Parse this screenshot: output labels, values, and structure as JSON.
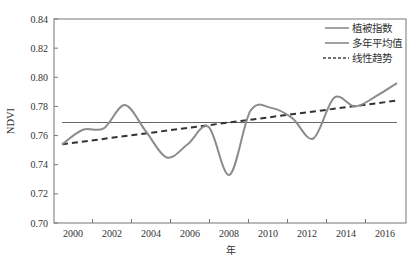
{
  "chart_data": {
    "type": "line",
    "title": "",
    "xlabel": "年",
    "ylabel": "NDVI",
    "ylim": [
      0.7,
      0.84
    ],
    "yticks": [
      0.7,
      0.72,
      0.74,
      0.76,
      0.78,
      0.8,
      0.82,
      0.84
    ],
    "ytick_labels": [
      "0.70",
      "0.72",
      "0.74",
      "0.76",
      "0.78",
      "0.80",
      "0.82",
      "0.84"
    ],
    "xtick_labels": [
      "2000",
      "2002",
      "2004",
      "2006",
      "2008",
      "2010",
      "2012",
      "2014",
      "2016"
    ],
    "grid": false,
    "legend_position": "top-right",
    "x": [
      2000,
      2001,
      2002,
      2003,
      2004,
      2005,
      2006,
      2007,
      2008,
      2009,
      2010,
      2011,
      2012,
      2013,
      2014,
      2015,
      2016
    ],
    "series": [
      {
        "name": "植被指数",
        "style": "solid-smooth",
        "color": "#8c8c8c",
        "values": [
          0.754,
          0.764,
          0.765,
          0.781,
          0.763,
          0.745,
          0.754,
          0.766,
          0.733,
          0.777,
          0.779,
          0.772,
          0.758,
          0.786,
          0.78,
          0.787,
          0.796
        ]
      },
      {
        "name": "多年平均值",
        "style": "solid",
        "color": "#666666",
        "values": [
          0.769,
          0.769,
          0.769,
          0.769,
          0.769,
          0.769,
          0.769,
          0.769,
          0.769,
          0.769,
          0.769,
          0.769,
          0.769,
          0.769,
          0.769,
          0.769,
          0.769
        ]
      },
      {
        "name": "线性趋势",
        "style": "dashed",
        "color": "#333333",
        "start": 0.754,
        "end": 0.784
      }
    ]
  },
  "legend": {
    "items": [
      {
        "label": "植被指数",
        "style": "solid"
      },
      {
        "label": "多年平均值",
        "style": "solid"
      },
      {
        "label": "线性趋势",
        "style": "dashed"
      }
    ]
  },
  "axes": {
    "xlabel": "年",
    "ylabel": "NDVI"
  }
}
